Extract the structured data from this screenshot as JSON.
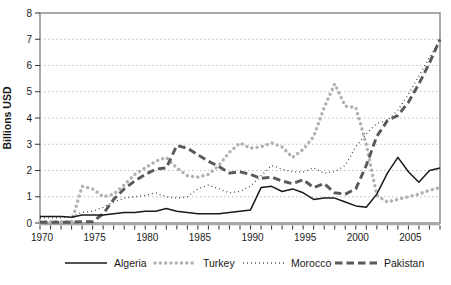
{
  "chart_data": {
    "type": "line",
    "title": "",
    "ylabel": "Billions USD",
    "xlabel": "",
    "ylim": [
      0,
      8
    ],
    "x_range": [
      1970,
      2008
    ],
    "x_major_ticks": [
      1970,
      1975,
      1980,
      1985,
      1990,
      1995,
      2000,
      2005
    ],
    "y_ticks": [
      0,
      1,
      2,
      3,
      4,
      5,
      6,
      7,
      8
    ],
    "grid": "horizontal-dashed",
    "legend_position": "bottom",
    "years": [
      1970,
      1971,
      1972,
      1973,
      1974,
      1975,
      1976,
      1977,
      1978,
      1979,
      1980,
      1981,
      1982,
      1983,
      1984,
      1985,
      1986,
      1987,
      1988,
      1989,
      1990,
      1991,
      1992,
      1993,
      1994,
      1995,
      1996,
      1997,
      1998,
      1999,
      2000,
      2001,
      2002,
      2003,
      2004,
      2005,
      2006,
      2007,
      2008
    ],
    "series": [
      {
        "name": "Algeria",
        "style": "solid",
        "color": "#1a1a1a",
        "width": 1.5,
        "values": [
          0.25,
          0.25,
          0.25,
          0.22,
          0.3,
          0.3,
          0.3,
          0.35,
          0.4,
          0.4,
          0.45,
          0.45,
          0.55,
          0.45,
          0.4,
          0.35,
          0.35,
          0.35,
          0.4,
          0.45,
          0.5,
          1.35,
          1.4,
          1.2,
          1.3,
          1.15,
          0.9,
          0.95,
          0.95,
          0.8,
          0.65,
          0.6,
          1.1,
          1.9,
          2.5,
          1.95,
          1.55,
          2.0,
          2.1
        ]
      },
      {
        "name": "Turkey",
        "style": "round-dots",
        "color": "#b2b2b2",
        "width": 3.4,
        "values": [
          0.05,
          0.05,
          0.05,
          0.05,
          1.4,
          1.3,
          1.0,
          1.1,
          1.45,
          1.85,
          2.1,
          2.35,
          2.5,
          2.1,
          1.8,
          1.75,
          1.85,
          2.2,
          2.7,
          3.05,
          2.85,
          2.9,
          3.05,
          2.9,
          2.5,
          2.8,
          3.3,
          4.4,
          5.3,
          4.45,
          4.4,
          3.0,
          1.05,
          0.8,
          0.9,
          1.0,
          1.1,
          1.25,
          1.35
        ]
      },
      {
        "name": "Morocco",
        "style": "fine-dots",
        "color": "#262626",
        "width": 1.3,
        "values": [
          0.2,
          0.2,
          0.2,
          0.25,
          0.4,
          0.45,
          0.6,
          0.8,
          0.95,
          1.0,
          1.05,
          1.15,
          1.0,
          0.95,
          1.0,
          1.3,
          1.45,
          1.3,
          1.15,
          1.2,
          1.4,
          1.8,
          2.2,
          2.05,
          1.95,
          1.95,
          2.1,
          1.9,
          1.95,
          2.2,
          2.9,
          3.4,
          3.8,
          3.9,
          4.3,
          4.9,
          5.6,
          6.3,
          7.0
        ]
      },
      {
        "name": "Pakistan",
        "style": "dashes",
        "color": "#595959",
        "width": 2.9,
        "values": [
          0.03,
          0.03,
          0.03,
          0.03,
          0.05,
          0.05,
          0.35,
          0.9,
          1.3,
          1.6,
          1.85,
          2.05,
          2.1,
          2.95,
          2.85,
          2.6,
          2.35,
          2.15,
          1.9,
          1.95,
          1.85,
          1.7,
          1.75,
          1.6,
          1.5,
          1.65,
          1.35,
          1.5,
          1.15,
          1.1,
          1.3,
          2.2,
          3.3,
          3.9,
          4.1,
          4.6,
          5.3,
          6.1,
          7.0
        ]
      }
    ],
    "colors": {
      "grid": "#bfbfbf",
      "frame": "#8c8c8c",
      "axis_bottom": "#a8a8a8",
      "tick": "#333333",
      "text": "#1a1a1a"
    }
  }
}
